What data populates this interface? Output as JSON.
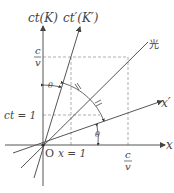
{
  "diagram": {
    "axes": {
      "ct_label": "ct(K)",
      "ct_prime_label": "ct′(K′)",
      "x_label": "x",
      "x_prime_label": "x′",
      "origin_label": "O",
      "light_label": "光"
    },
    "ticks": {
      "ct_one": "ct = 1",
      "x_one": "x = 1",
      "c_over_v_num": "c",
      "c_over_v_den": "v"
    },
    "angle_marks": {
      "theta_label": "θ",
      "equal_mark": "//"
    },
    "colors": {
      "line": "#555555",
      "dash": "#999999",
      "text": "#444444"
    }
  }
}
